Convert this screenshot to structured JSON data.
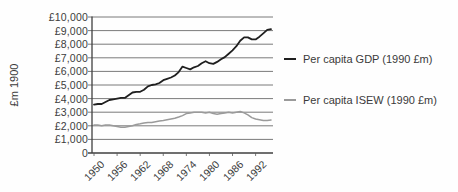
{
  "colors": {
    "gdp_line": "#1f1f1f",
    "isew_line": "#9a9a9a",
    "gridline": "#585858",
    "axis": "#3f3f3f",
    "tick_text": "#3c3c3c"
  },
  "chart_data": {
    "type": "line",
    "title": "",
    "xlabel": "",
    "ylabel": "£m 1900",
    "ylim": [
      0,
      10000
    ],
    "y_tick_step": 1000,
    "grid": true,
    "legend_position": "right",
    "y_tick_labels": [
      "0",
      "£1,000",
      "£2,000",
      "£3,000",
      "£4,000",
      "£5,000",
      "£6,000",
      "£7,000",
      "£8,000",
      "£9,000",
      "£10,000"
    ],
    "x_tick_labels": [
      "1950",
      "1956",
      "1962",
      "1968",
      "1974",
      "1980",
      "1986",
      "1992"
    ],
    "x": [
      1950,
      1951,
      1952,
      1953,
      1954,
      1955,
      1956,
      1957,
      1958,
      1959,
      1960,
      1961,
      1962,
      1963,
      1964,
      1965,
      1966,
      1967,
      1968,
      1969,
      1970,
      1971,
      1972,
      1973,
      1974,
      1975,
      1976,
      1977,
      1978,
      1979,
      1980,
      1981,
      1982,
      1983,
      1984,
      1985,
      1986,
      1987,
      1988,
      1989,
      1990,
      1991,
      1992,
      1993,
      1994,
      1995,
      1996
    ],
    "series": [
      {
        "name": "Per capita GDP (1990 £m)",
        "color": "#1f1f1f",
        "values": [
          3550,
          3600,
          3600,
          3750,
          3900,
          3950,
          4000,
          4050,
          4050,
          4250,
          4450,
          4500,
          4500,
          4650,
          4900,
          5000,
          5050,
          5150,
          5350,
          5450,
          5550,
          5700,
          5950,
          6350,
          6250,
          6150,
          6300,
          6400,
          6600,
          6750,
          6600,
          6550,
          6700,
          6900,
          7050,
          7300,
          7550,
          7850,
          8250,
          8500,
          8500,
          8350,
          8350,
          8550,
          8800,
          9050,
          9100
        ]
      },
      {
        "name": "Per capita ISEW (1990 £m)",
        "color": "#9a9a9a",
        "values": [
          2050,
          2050,
          2000,
          2050,
          2050,
          2000,
          1950,
          1900,
          1900,
          1950,
          2000,
          2100,
          2150,
          2200,
          2250,
          2250,
          2300,
          2350,
          2400,
          2450,
          2500,
          2550,
          2650,
          2750,
          2900,
          2950,
          3000,
          3000,
          3000,
          2950,
          3000,
          2900,
          2850,
          2900,
          2950,
          3000,
          2950,
          3000,
          3050,
          2950,
          2800,
          2600,
          2500,
          2450,
          2400,
          2400,
          2420
        ]
      }
    ]
  }
}
